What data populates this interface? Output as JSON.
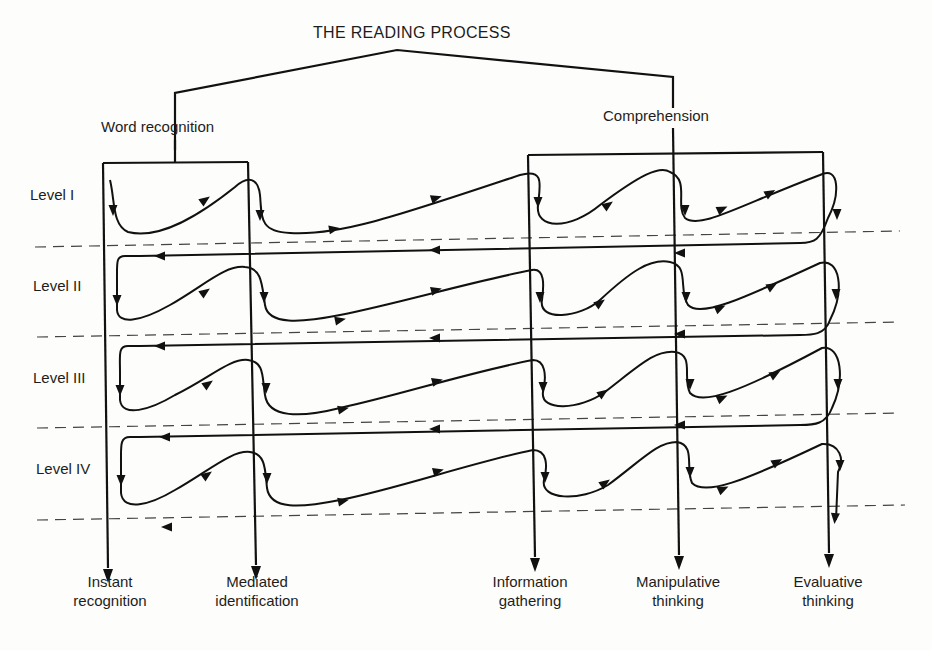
{
  "diagram": {
    "title": "THE READING PROCESS",
    "branches": {
      "left": "Word recognition",
      "right": "Comprehension"
    },
    "levels": [
      {
        "label": "Level I",
        "x": 30,
        "y": 185
      },
      {
        "label": "Level II",
        "x": 33,
        "y": 276
      },
      {
        "label": "Level III",
        "x": 33,
        "y": 368
      },
      {
        "label": "Level IV",
        "x": 36,
        "y": 459
      }
    ],
    "outcomes": [
      {
        "line1": "Instant",
        "line2": "recognition",
        "x": 110
      },
      {
        "line1": "Mediated",
        "line2": "identification",
        "x": 257
      },
      {
        "line1": "Information",
        "line2": "gathering",
        "x": 530
      },
      {
        "line1": "Manipulative",
        "line2": "thinking",
        "x": 678
      },
      {
        "line1": "Evaluative",
        "line2": "thinking",
        "x": 828
      }
    ],
    "colors": {
      "ink": "#111111",
      "paper": "#fdfdfb",
      "dash": "#444444"
    },
    "geometry": {
      "tree": "M175,150 L175,93 L397,50 L673,77 L673,108",
      "tree_left_stem": "M175,140 L175,163",
      "box_left": "M103,163 L248,162",
      "box_right": "M528,155 L823,152",
      "verticals": [
        {
          "name": "instant-recognition-line",
          "d": "M103,163 L108,568",
          "arrow": [
            108,
            575
          ]
        },
        {
          "name": "mediated-identification-line",
          "d": "M248,162 L256,565",
          "arrow": [
            256,
            572
          ]
        },
        {
          "name": "information-gathering-line",
          "d": "M528,155 L535,557",
          "arrow": [
            535,
            564
          ]
        },
        {
          "name": "manipulative-thinking-line",
          "d": "M673,128 L679,555",
          "arrow": [
            679,
            562
          ]
        },
        {
          "name": "evaluative-thinking-line",
          "d": "M823,152 L829,553",
          "arrow": [
            829,
            560
          ]
        }
      ],
      "dashes": [
        "M35,247 L900,231",
        "M37,337 L900,322",
        "M37,428 L900,413",
        "M37,520 L905,505"
      ],
      "flows": [
        "M110,180 C115,200 112,225 128,232 C160,240 200,215 235,187 C248,175 258,178 260,195 C262,215 258,232 290,233 C340,236 400,215 520,175 C545,168 540,185 538,205 C535,230 570,230 600,205 C640,175 660,165 670,172 C690,180 675,205 685,218 C700,230 740,205 820,175 C840,165 840,195 828,218 C820,240 815,243 800,243 L140,256",
        "M140,256 L125,256 C116,256 117,262 117,280 L117,310 C118,325 140,322 170,305 C205,285 225,265 245,267 C262,268 262,285 265,305 C268,325 300,323 340,315 C400,303 470,282 532,270 C545,268 544,285 542,300 C538,322 580,318 600,300 C630,272 650,258 670,262 C690,266 678,290 688,305 C700,318 740,300 820,263 C840,258 845,290 830,320 C825,335 812,335 800,335 L140,346",
        "M140,346 L128,346 C118,346 120,355 120,372 L120,400 C122,418 150,410 175,395 C210,378 230,358 248,360 C265,362 262,378 265,395 C268,418 300,418 340,408 C400,395 470,372 533,360 C545,360 547,375 543,392 C540,412 580,410 605,392 C640,365 655,350 675,352 C695,355 682,378 690,393 C702,406 740,392 822,348 C842,345 845,380 832,408 C826,424 815,425 800,425 L140,437",
        "M140,437 L130,437 C120,437 121,445 121,462 L121,493 C123,512 150,505 175,490 C210,470 232,450 250,452 C266,454 265,470 267,488 C270,510 300,508 340,500 C400,488 470,463 533,450 C547,450 548,465 544,480 C540,500 580,502 608,485 C642,460 657,442 677,442 C696,445 685,468 692,483 C705,496 742,482 822,444 C840,443 845,460 838,472 L836,520"
      ],
      "arrowheads": [
        [
          113,
          210,
          90
        ],
        [
          205,
          200,
          -35
        ],
        [
          260,
          215,
          90
        ],
        [
          334,
          229,
          -10
        ],
        [
          436,
          198,
          -18
        ],
        [
          538,
          202,
          90
        ],
        [
          608,
          205,
          -35
        ],
        [
          685,
          210,
          90
        ],
        [
          722,
          209,
          -25
        ],
        [
          770,
          193,
          -30
        ],
        [
          837,
          214,
          90
        ],
        [
          680,
          253,
          180
        ],
        [
          435,
          250,
          180
        ],
        [
          117,
          300,
          90
        ],
        [
          205,
          292,
          -35
        ],
        [
          264,
          297,
          90
        ],
        [
          340,
          320,
          -12
        ],
        [
          436,
          290,
          -15
        ],
        [
          540,
          297,
          90
        ],
        [
          600,
          303,
          -35
        ],
        [
          686,
          297,
          90
        ],
        [
          720,
          308,
          -25
        ],
        [
          772,
          286,
          -30
        ],
        [
          836,
          294,
          90
        ],
        [
          680,
          334,
          180
        ],
        [
          435,
          338,
          180
        ],
        [
          120,
          390,
          90
        ],
        [
          208,
          384,
          -35
        ],
        [
          266,
          388,
          90
        ],
        [
          343,
          409,
          -12
        ],
        [
          437,
          381,
          -15
        ],
        [
          543,
          387,
          90
        ],
        [
          603,
          393,
          -35
        ],
        [
          690,
          384,
          90
        ],
        [
          722,
          398,
          -25
        ],
        [
          775,
          374,
          -30
        ],
        [
          838,
          384,
          90
        ],
        [
          680,
          425,
          180
        ],
        [
          435,
          429,
          180
        ],
        [
          121,
          480,
          90
        ],
        [
          207,
          475,
          -35
        ],
        [
          267,
          478,
          90
        ],
        [
          343,
          501,
          -12
        ],
        [
          438,
          471,
          -15
        ],
        [
          545,
          477,
          90
        ],
        [
          605,
          483,
          -35
        ],
        [
          690,
          472,
          90
        ],
        [
          723,
          489,
          -25
        ],
        [
          777,
          462,
          -30
        ],
        [
          840,
          465,
          90
        ],
        [
          835,
          518,
          95
        ],
        [
          160,
          256,
          180
        ],
        [
          160,
          346,
          180
        ],
        [
          165,
          437,
          180
        ],
        [
          167,
          527,
          180
        ]
      ]
    }
  }
}
